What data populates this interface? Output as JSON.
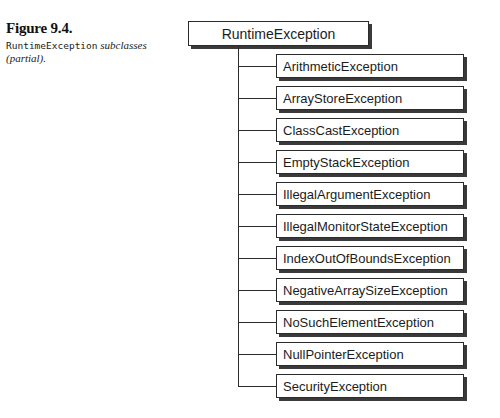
{
  "caption": {
    "figure_number": "Figure 9.4.",
    "code_term": "RuntimeException",
    "text_after_code": " subclasses",
    "line2": "(partial)."
  },
  "diagram": {
    "root": "RuntimeException",
    "children": [
      "ArithmeticException",
      "ArrayStoreException",
      "ClassCastException",
      "EmptyStackException",
      "IllegalArgumentException",
      "IllegalMonitorStateException",
      "IndexOutOfBoundsException",
      "NegativeArraySizeException",
      "NoSuchElementException",
      "NullPointerException",
      "SecurityException"
    ],
    "layout": {
      "first_branch_y": 66,
      "spacing": 32,
      "box_height": 24
    },
    "colors": {
      "line": "#2b2b2b",
      "shadow": "#3a3a3a",
      "box_fill": "#ffffff"
    }
  }
}
